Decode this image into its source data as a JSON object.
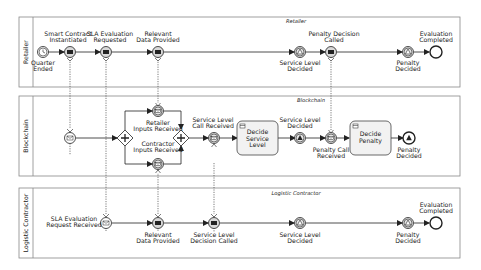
{
  "pools": [
    {
      "id": "retailer",
      "lane_label": "Retailer",
      "title": "Retailer",
      "y": 17,
      "h": 70
    },
    {
      "id": "blockchain",
      "lane_label": "Blockchain",
      "title": "Blockchain",
      "y": 96,
      "h": 80
    },
    {
      "id": "logistic",
      "lane_label": "Logistic Contractor",
      "title": "Logistic Contractor",
      "y": 188,
      "h": 70
    }
  ],
  "retailer": {
    "quarter_ended": [
      "Quarter",
      "Ended"
    ],
    "smart_contract": [
      "Smart Contract",
      "Instantiated"
    ],
    "sla_requested": [
      "SLA Evaluation",
      "Requested"
    ],
    "data_provided": [
      "Relevant",
      "Data Provided"
    ],
    "service_level_decided": [
      "Service Level",
      "Decided"
    ],
    "penalty_called": [
      "Penalty Decision",
      "Called"
    ],
    "penalty_decided": [
      "Penalty",
      "Decided"
    ],
    "evaluation_completed": [
      "Evaluation",
      "Completed"
    ]
  },
  "blockchain": {
    "retailer_inputs": [
      "Retailer",
      "Inputs Received"
    ],
    "contractor_inputs": [
      "Contractor",
      "Inputs Received"
    ],
    "sl_call_received": [
      "Service Level",
      "Call Received"
    ],
    "decide_service_level": [
      "Decide",
      "Service",
      "Level"
    ],
    "service_level_decided": [
      "Service Level",
      "Decided"
    ],
    "penalty_call_received": [
      "Penalty Call",
      "Received"
    ],
    "decide_penalty": [
      "Decide",
      "Penalty"
    ],
    "penalty_decided": [
      "Penalty",
      "Decided"
    ]
  },
  "logistic": {
    "sla_request_received": [
      "SLA Evaluation",
      "Request Received"
    ],
    "data_provided": [
      "Relevant",
      "Data Provided"
    ],
    "sl_decision_called": [
      "Service Level",
      "Decision Called"
    ],
    "service_level_decided": [
      "Service Level",
      "Decided"
    ],
    "penalty_decided": [
      "Penalty",
      "Decided"
    ],
    "evaluation_completed": [
      "Evaluation",
      "Completed"
    ]
  },
  "colors": {
    "stroke": "#222222",
    "pool_border": "#888888",
    "task_fill": "#f2f2f2",
    "event_fill": "#ffffff",
    "signal_fill": "#e6e6e6"
  }
}
